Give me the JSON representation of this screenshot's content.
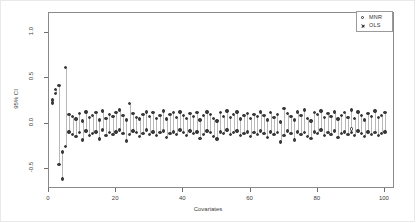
{
  "figure": {
    "y_axis_title": "95% CI",
    "x_axis_title": "Covariates"
  },
  "legend": {
    "entries": [
      {
        "label": "MNR",
        "marker": "circle-open-icon"
      },
      {
        "label": "OLS",
        "marker": "cross-icon"
      }
    ]
  },
  "chart_data": {
    "type": "scatter",
    "title": "",
    "subtitle": "",
    "xlabel": "Covariates",
    "ylabel": "95% CI",
    "xlim": [
      0,
      103
    ],
    "ylim": [
      -0.72,
      1.22
    ],
    "grid": false,
    "legend_position": "top-right",
    "xticks": [
      0,
      20,
      40,
      60,
      80,
      100
    ],
    "xtick_labels": [
      "0",
      "20",
      "40",
      "60",
      "80",
      "100"
    ],
    "yticks": [
      -0.5,
      0.0,
      0.5,
      1.0
    ],
    "ytick_labels": [
      "-0.5",
      "0.0",
      "0.5",
      "1.0"
    ],
    "annotations": [],
    "series": [
      {
        "name": "MNR",
        "marker": "circle-open",
        "x": [
          1,
          2,
          3,
          4,
          5,
          6,
          7,
          8,
          9,
          10,
          11,
          12,
          13,
          14,
          15,
          16,
          17,
          18,
          19,
          20,
          21,
          22,
          23,
          24,
          25,
          26,
          27,
          28,
          29,
          30,
          31,
          32,
          33,
          34,
          35,
          36,
          37,
          38,
          39,
          40,
          41,
          42,
          43,
          44,
          45,
          46,
          47,
          48,
          49,
          50,
          51,
          52,
          53,
          54,
          55,
          56,
          57,
          58,
          59,
          60,
          61,
          62,
          63,
          64,
          65,
          66,
          67,
          68,
          69,
          70,
          71,
          72,
          73,
          74,
          75,
          76,
          77,
          78,
          79,
          80,
          81,
          82,
          83,
          84,
          85,
          86,
          87,
          88,
          89,
          90,
          91,
          92,
          93,
          94,
          95,
          96,
          97,
          98,
          99,
          100
        ],
        "lower": [
          0.23,
          0.33,
          -0.45,
          -0.61,
          -0.25,
          -0.09,
          -0.12,
          -0.14,
          -0.1,
          -0.18,
          -0.08,
          -0.13,
          -0.11,
          -0.09,
          -0.17,
          -0.07,
          -0.13,
          -0.1,
          -0.12,
          -0.09,
          -0.07,
          -0.11,
          -0.19,
          -0.12,
          -0.08,
          -0.1,
          -0.14,
          -0.11,
          -0.07,
          -0.12,
          -0.09,
          -0.13,
          -0.1,
          -0.08,
          -0.15,
          -0.11,
          -0.09,
          -0.12,
          -0.07,
          -0.1,
          -0.13,
          -0.08,
          -0.11,
          -0.09,
          -0.16,
          -0.12,
          -0.08,
          -0.1,
          -0.14,
          -0.17,
          -0.09,
          -0.11,
          -0.07,
          -0.12,
          -0.1,
          -0.08,
          -0.13,
          -0.11,
          -0.09,
          -0.14,
          -0.1,
          -0.12,
          -0.08,
          -0.11,
          -0.15,
          -0.09,
          -0.12,
          -0.1,
          -0.2,
          -0.13,
          -0.08,
          -0.11,
          -0.18,
          -0.09,
          -0.12,
          -0.1,
          -0.14,
          -0.16,
          -0.09,
          -0.11,
          -0.07,
          -0.13,
          -0.1,
          -0.12,
          -0.08,
          -0.15,
          -0.11,
          -0.09,
          -0.12,
          -0.1,
          -0.13,
          -0.08,
          -0.11,
          -0.14,
          -0.09,
          -0.12,
          -0.1,
          -0.13,
          -0.11,
          -0.09
        ],
        "upper": [
          0.26,
          0.38,
          0.42,
          -0.31,
          0.62,
          0.1,
          0.08,
          0.05,
          0.11,
          0.03,
          0.13,
          0.07,
          0.09,
          0.12,
          0.04,
          0.14,
          0.06,
          0.1,
          0.08,
          0.12,
          0.15,
          0.09,
          0.04,
          0.22,
          0.11,
          0.07,
          0.05,
          0.1,
          0.13,
          0.08,
          0.12,
          0.06,
          0.09,
          0.14,
          0.05,
          0.1,
          0.12,
          0.07,
          0.13,
          0.09,
          0.06,
          0.11,
          0.08,
          0.12,
          0.04,
          0.09,
          0.13,
          0.1,
          0.06,
          0.03,
          0.12,
          0.08,
          0.14,
          0.07,
          0.1,
          0.13,
          0.05,
          0.09,
          0.11,
          0.06,
          0.1,
          0.08,
          0.13,
          0.09,
          0.04,
          0.12,
          0.07,
          0.1,
          0.02,
          0.17,
          0.11,
          0.08,
          0.04,
          0.13,
          0.09,
          0.15,
          0.06,
          0.03,
          0.12,
          0.1,
          0.14,
          0.07,
          0.11,
          0.08,
          0.13,
          0.05,
          0.09,
          0.12,
          0.07,
          0.15,
          0.06,
          0.13,
          0.09,
          0.04,
          0.11,
          0.08,
          0.14,
          0.07,
          0.09,
          0.12
        ]
      },
      {
        "name": "OLS",
        "marker": "cross",
        "x": [
          1,
          2,
          3,
          4,
          5,
          6,
          7,
          8,
          9,
          10,
          11,
          12,
          13,
          14,
          15,
          16,
          17,
          18,
          19,
          20,
          21,
          22,
          23,
          24,
          25,
          26,
          27,
          28,
          29,
          30,
          31,
          32,
          33,
          34,
          35,
          36,
          37,
          38,
          39,
          40,
          41,
          42,
          43,
          44,
          45,
          46,
          47,
          48,
          49,
          50,
          51,
          52,
          53,
          54,
          55,
          56,
          57,
          58,
          59,
          60,
          61,
          62,
          63,
          64,
          65,
          66,
          67,
          68,
          69,
          70,
          71,
          72,
          73,
          74,
          75,
          76,
          77,
          78,
          79,
          80,
          81,
          82,
          83,
          84,
          85,
          86,
          87,
          88,
          89,
          90,
          91,
          92,
          93,
          94,
          95,
          96,
          97,
          98,
          99,
          100
        ],
        "lower": [
          0.23,
          0.33,
          -0.45,
          -0.61,
          -0.25,
          -0.09,
          -0.12,
          -0.14,
          -0.1,
          -0.18,
          -0.08,
          -0.13,
          -0.11,
          -0.09,
          -0.17,
          -0.07,
          -0.13,
          -0.1,
          -0.12,
          -0.09,
          -0.07,
          -0.11,
          -0.19,
          -0.12,
          -0.08,
          -0.1,
          -0.14,
          -0.11,
          -0.07,
          -0.12,
          -0.09,
          -0.13,
          -0.1,
          -0.08,
          -0.15,
          -0.11,
          -0.09,
          -0.12,
          -0.07,
          -0.1,
          -0.13,
          -0.08,
          -0.11,
          -0.09,
          -0.16,
          -0.12,
          -0.08,
          -0.1,
          -0.14,
          -0.17,
          -0.09,
          -0.11,
          -0.07,
          -0.12,
          -0.1,
          -0.08,
          -0.13,
          -0.11,
          -0.09,
          -0.14,
          -0.1,
          -0.12,
          -0.08,
          -0.11,
          -0.15,
          -0.09,
          -0.12,
          -0.1,
          -0.2,
          -0.13,
          -0.08,
          -0.11,
          -0.18,
          -0.09,
          -0.12,
          -0.1,
          -0.14,
          -0.16,
          -0.09,
          -0.11,
          -0.07,
          -0.13,
          -0.1,
          -0.12,
          -0.08,
          -0.15,
          -0.11,
          -0.09,
          -0.12,
          -0.06,
          -0.13,
          -0.08,
          -0.11,
          -0.14,
          -0.09,
          -0.12,
          -0.1,
          -0.13,
          -0.11,
          -0.09
        ],
        "upper": [
          0.26,
          0.38,
          0.42,
          -0.31,
          0.62,
          0.1,
          0.08,
          0.05,
          0.11,
          0.03,
          0.13,
          0.07,
          0.09,
          0.12,
          0.04,
          0.14,
          0.06,
          0.1,
          0.08,
          0.12,
          0.15,
          0.09,
          0.04,
          0.22,
          0.11,
          0.07,
          0.05,
          0.1,
          0.13,
          0.08,
          0.12,
          0.06,
          0.09,
          0.14,
          0.05,
          0.1,
          0.12,
          0.07,
          0.13,
          0.09,
          0.06,
          0.11,
          0.08,
          0.12,
          0.04,
          0.09,
          0.13,
          0.1,
          0.06,
          0.03,
          0.12,
          0.08,
          0.14,
          0.07,
          0.1,
          0.13,
          0.05,
          0.09,
          0.11,
          0.06,
          0.1,
          0.08,
          0.13,
          0.09,
          0.04,
          0.12,
          0.07,
          0.1,
          0.02,
          0.17,
          0.11,
          0.08,
          0.04,
          0.13,
          0.09,
          0.15,
          0.06,
          0.03,
          0.12,
          0.1,
          0.14,
          0.07,
          0.11,
          0.08,
          0.13,
          0.05,
          0.09,
          0.12,
          0.07,
          0.15,
          0.06,
          0.13,
          0.09,
          0.04,
          0.11,
          0.08,
          0.14,
          0.07,
          0.09,
          0.12
        ]
      }
    ]
  }
}
